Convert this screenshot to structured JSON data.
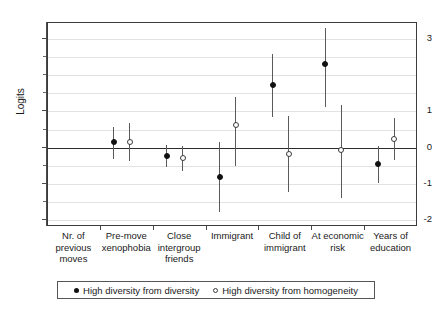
{
  "chart_data": {
    "type": "scatter",
    "title": "",
    "xlabel": "",
    "ylabel": "Logits",
    "ylim": [
      -2.2,
      3.45
    ],
    "yticks": [
      3,
      1,
      0,
      -1,
      -2
    ],
    "ytick_labels": [
      "3",
      "1",
      "0",
      "-1",
      "-2"
    ],
    "yminor_ticks": [
      2.5,
      2,
      1.5,
      0.5,
      -0.5,
      -1.5
    ],
    "grid": "horizontal",
    "zero_reference_line": 0,
    "legend_position": "bottom",
    "categories": [
      "Nr. of previous moves",
      "Pre-move xenophobia",
      "Close intergroup friends",
      "Immigrant",
      "Child of immigrant",
      "At economic risk",
      "Years of education"
    ],
    "category_lines": [
      [
        "Nr. of",
        "previous",
        "moves"
      ],
      [
        "Pre-move",
        "xenophobia",
        ""
      ],
      [
        "Close",
        "intergroup",
        "friends"
      ],
      [
        "Immigrant",
        "",
        ""
      ],
      [
        "Child of",
        "immigrant",
        ""
      ],
      [
        "At economic",
        "risk",
        ""
      ],
      [
        "Years of",
        "education",
        ""
      ]
    ],
    "series": [
      {
        "name": "High diversity from diversity",
        "marker": "filled-circle",
        "values": [
          0.15,
          -0.22,
          -0.81,
          1.74,
          2.31,
          -0.46,
          -0.02
        ],
        "ci_low": [
          -0.32,
          -0.53,
          -1.79,
          0.85,
          1.12,
          -0.98,
          -0.06
        ],
        "ci_high": [
          0.58,
          0.06,
          0.16,
          2.58,
          3.32,
          0.04,
          0.02
        ]
      },
      {
        "name": "High diversity from homogeneity",
        "marker": "open-circle",
        "values": [
          0.16,
          -0.29,
          0.62,
          -0.19,
          -0.06,
          0.24,
          -0.02
        ],
        "ci_low": [
          -0.36,
          -0.65,
          -0.5,
          -1.23,
          -1.39,
          -0.34,
          -0.06
        ],
        "ci_high": [
          0.69,
          0.03,
          1.41,
          0.88,
          1.17,
          0.82,
          0.02
        ]
      }
    ]
  },
  "legend": {
    "entries": [
      {
        "label": "High diversity from diversity",
        "marker": "filled-circle"
      },
      {
        "label": "High diversity from homogeneity",
        "marker": "open-circle"
      }
    ]
  }
}
